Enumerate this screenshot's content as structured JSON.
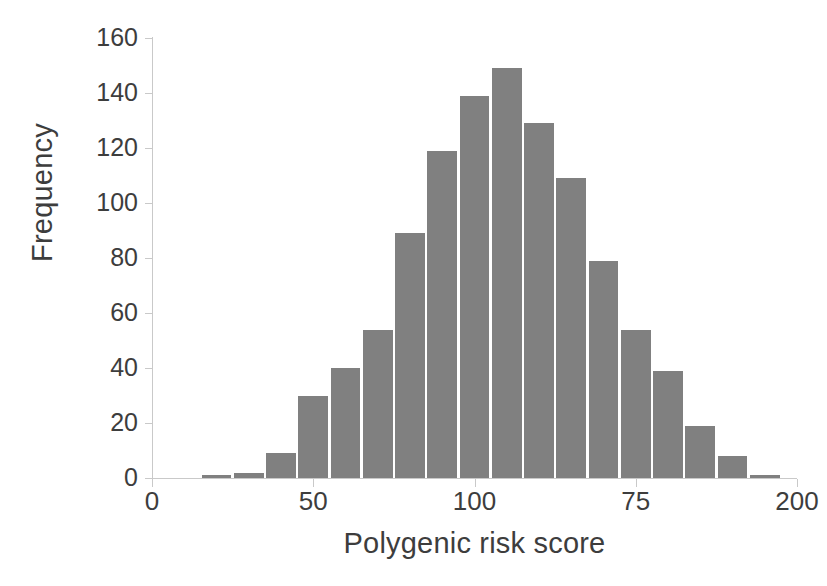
{
  "chart_data": {
    "type": "bar",
    "title": "",
    "subtitle": "",
    "xlabel": "Polygenic risk score",
    "ylabel": "Frequency",
    "grid": false,
    "legend": null,
    "legend_position": "none",
    "bar_color": "#808080",
    "axis_color": "#c9c9c9",
    "text_color": "#3d3d3d",
    "background_color": "#ffffff",
    "xlim": [
      0,
      200
    ],
    "ylim": [
      0,
      160
    ],
    "xticks": [
      0,
      50,
      100,
      75,
      200
    ],
    "xtick_labels": [
      "0",
      "50",
      "100",
      "75",
      "200"
    ],
    "xtick_positions": [
      0,
      50,
      100,
      150,
      200
    ],
    "yticks": [
      0,
      20,
      40,
      60,
      80,
      100,
      120,
      140,
      160
    ],
    "ytick_labels": [
      "0",
      "20",
      "40",
      "60",
      "80",
      "100",
      "120",
      "140",
      "160"
    ],
    "bin_width": 10,
    "bin_starts": [
      15,
      25,
      35,
      45,
      55,
      65,
      75,
      85,
      95,
      105,
      115,
      125,
      135,
      145,
      155,
      165,
      175,
      185
    ],
    "bin_centers": [
      20,
      30,
      40,
      50,
      60,
      70,
      80,
      90,
      100,
      110,
      120,
      130,
      140,
      150,
      160,
      170,
      180,
      190
    ],
    "values": [
      1,
      2,
      9,
      30,
      40,
      54,
      89,
      119,
      139,
      149,
      129,
      109,
      79,
      54,
      39,
      19,
      8,
      1
    ],
    "n_bars": 18
  }
}
